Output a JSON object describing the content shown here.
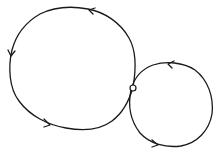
{
  "diagram": {
    "type": "two-loop-contour",
    "stroke_color": "#1a1a1a",
    "background": "#ffffff",
    "loops": [
      {
        "name": "large-loop",
        "direction": "counterclockwise",
        "arrows": 3
      },
      {
        "name": "small-loop",
        "direction": "counterclockwise",
        "arrows": 2
      }
    ],
    "junction": {
      "marker": "open-circle"
    }
  }
}
